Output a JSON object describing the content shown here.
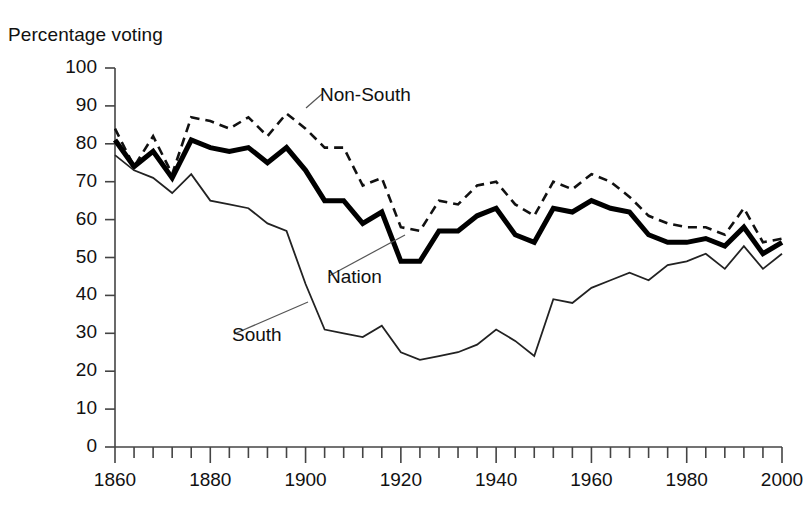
{
  "chart_data": {
    "type": "line",
    "title": "",
    "ylabel": "Percentage voting",
    "xlabel": "",
    "ylim": [
      0,
      100
    ],
    "xlim": [
      1860,
      2000
    ],
    "grid": false,
    "legend_position": "inline-annotations",
    "y_ticks": [
      0,
      10,
      20,
      30,
      40,
      50,
      60,
      70,
      80,
      90,
      100
    ],
    "y_tick_labels": [
      "0",
      "10",
      "20",
      "30",
      "40",
      "50",
      "60",
      "70",
      "80",
      "90",
      "100"
    ],
    "x_ticks_major": [
      1860,
      1880,
      1900,
      1920,
      1940,
      1960,
      1980,
      2000
    ],
    "x_tick_labels": [
      "1860",
      "1880",
      "1900",
      "1920",
      "1940",
      "1960",
      "1980",
      "2000"
    ],
    "x_tick_minor_interval": 4,
    "x": [
      1860,
      1864,
      1868,
      1872,
      1876,
      1880,
      1884,
      1888,
      1892,
      1896,
      1900,
      1904,
      1908,
      1912,
      1916,
      1920,
      1924,
      1928,
      1932,
      1936,
      1940,
      1944,
      1948,
      1952,
      1956,
      1960,
      1964,
      1968,
      1972,
      1976,
      1980,
      1984,
      1988,
      1992,
      1996,
      2000
    ],
    "series": [
      {
        "name": "Non-South",
        "style": "dashed",
        "color": "#111111",
        "values": [
          84,
          74,
          82,
          72,
          87,
          86,
          84,
          87,
          82,
          88,
          84,
          79,
          79,
          69,
          71,
          58,
          57,
          65,
          64,
          69,
          70,
          64,
          61,
          70,
          68,
          72,
          70,
          66,
          61,
          59,
          58,
          58,
          56,
          63,
          54,
          55
        ]
      },
      {
        "name": "Nation",
        "style": "solid-bold",
        "color": "#000000",
        "values": [
          81,
          74,
          78,
          71,
          81,
          79,
          78,
          79,
          75,
          79,
          73,
          65,
          65,
          59,
          62,
          49,
          49,
          57,
          57,
          61,
          63,
          56,
          54,
          63,
          62,
          65,
          63,
          62,
          56,
          54,
          54,
          55,
          53,
          58,
          51,
          54
        ]
      },
      {
        "name": "South",
        "style": "solid-thin",
        "color": "#222222",
        "values": [
          77,
          73,
          71,
          67,
          72,
          65,
          64,
          63,
          59,
          57,
          43,
          31,
          30,
          29,
          32,
          25,
          23,
          24,
          25,
          27,
          31,
          28,
          24,
          39,
          38,
          42,
          44,
          46,
          44,
          48,
          49,
          51,
          47,
          53,
          47,
          51
        ]
      }
    ],
    "annotations": [
      {
        "text": "Non-South",
        "x_px": 320,
        "y_px": 84,
        "leader_to": [
          306,
          108
        ]
      },
      {
        "text": "Nation",
        "x_px": 327,
        "y_px": 266,
        "leader_to": [
          405,
          235
        ]
      },
      {
        "text": "South",
        "x_px": 232,
        "y_px": 324,
        "leader_to": [
          308,
          302
        ]
      }
    ]
  }
}
